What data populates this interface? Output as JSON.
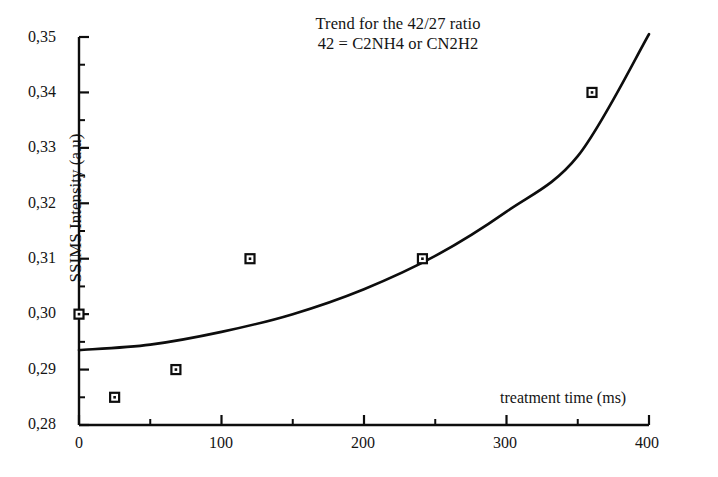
{
  "chart_data": {
    "type": "scatter",
    "title": "Trend for the 42/27 ratio",
    "subtitle": "42 = C2NH4 or CN2H2",
    "xlabel": "treatment time (ms)",
    "ylabel": "SSIMS Intensity (a.u)",
    "xlim": [
      0,
      400
    ],
    "ylim": [
      0.28,
      0.35
    ],
    "grid": false,
    "legend": null,
    "decimal_separator": ",",
    "x_ticks": [
      0,
      100,
      200,
      300,
      400
    ],
    "x_tick_labels": [
      "0",
      "100",
      "200",
      "300",
      "400"
    ],
    "x_minor_ticks": [
      50,
      150,
      250,
      350
    ],
    "y_ticks": [
      0.28,
      0.29,
      0.3,
      0.31,
      0.32,
      0.33,
      0.34,
      0.35
    ],
    "y_tick_labels": [
      "0,28",
      "0,29",
      "0,30",
      "0,31",
      "0,32",
      "0,33",
      "0,34",
      "0,35"
    ],
    "y_minor_ticks": [
      0.285,
      0.295,
      0.305,
      0.315,
      0.325,
      0.335,
      0.345
    ],
    "marker_style": "open-square",
    "series": [
      {
        "name": "42/27 ratio measurements",
        "type": "scatter",
        "x": [
          0,
          25,
          68,
          120,
          241,
          360
        ],
        "y": [
          0.3,
          0.285,
          0.29,
          0.31,
          0.31,
          0.34
        ]
      },
      {
        "name": "trend line",
        "type": "line",
        "x": [
          0,
          50,
          100,
          150,
          200,
          250,
          300,
          350,
          400
        ],
        "y": [
          0.2935,
          0.2945,
          0.2968,
          0.3,
          0.3045,
          0.3105,
          0.3185,
          0.3285,
          0.3505
        ]
      }
    ]
  },
  "axes": {
    "y_axis_name": "y-axis",
    "x_axis_name": "x-axis"
  }
}
